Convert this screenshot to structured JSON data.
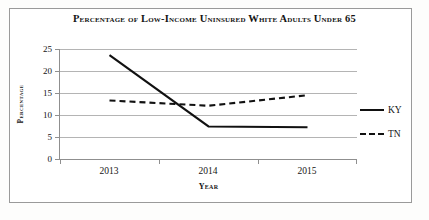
{
  "chart_data": {
    "type": "line",
    "title": "Percentage of Low-Income Uninsured White Adults Under 65",
    "xlabel": "Year",
    "ylabel": "Percentage",
    "categories": [
      "2013",
      "2014",
      "2015"
    ],
    "series": [
      {
        "name": "KY",
        "style": "solid",
        "values": [
          23.6,
          7.4,
          7.2
        ]
      },
      {
        "name": "TN",
        "style": "dashed",
        "values": [
          13.3,
          12.1,
          14.5
        ]
      }
    ],
    "ylim": [
      0,
      25
    ],
    "yticks": [
      "0",
      "5",
      "10",
      "15",
      "20",
      "25"
    ],
    "grid": true,
    "legend_position": "right",
    "line_color": "#111111"
  },
  "legend": {
    "entries": [
      {
        "label": "KY"
      },
      {
        "label": "TN"
      }
    ]
  }
}
